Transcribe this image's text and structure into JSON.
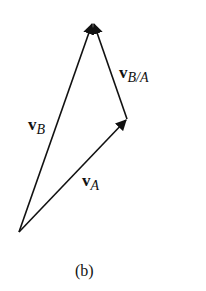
{
  "figure": {
    "caption": "(b)",
    "colors": {
      "stroke": "#111111",
      "background": "#ffffff"
    },
    "points": {
      "origin": [
        19,
        232
      ],
      "a_head": [
        127,
        119
      ],
      "b_head": [
        93,
        22
      ]
    },
    "vectors": [
      {
        "id": "vA",
        "symbol": "v",
        "subscript": "A",
        "from": "origin",
        "to": "a_head"
      },
      {
        "id": "vB",
        "symbol": "v",
        "subscript": "B",
        "from": "origin",
        "to": "b_head"
      },
      {
        "id": "vBA",
        "symbol": "v",
        "subscript": "B/A",
        "from": "a_head",
        "to": "b_head"
      }
    ],
    "labels": {
      "vB": {
        "symbol": "v",
        "subscript": "B"
      },
      "vA": {
        "symbol": "v",
        "subscript": "A"
      },
      "vBA": {
        "symbol": "v",
        "subscript": "B/A"
      }
    }
  }
}
